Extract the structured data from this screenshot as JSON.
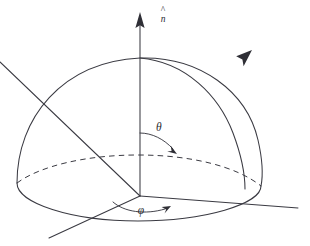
{
  "figure": {
    "kind": "spherical-coordinates-hemisphere",
    "background_color": "#ffffff",
    "line_color": "#3a3a42",
    "label_color": "#2b2b31",
    "labels": {
      "normal_vector": "n",
      "normal_vector_accent": "^",
      "normal_vector_full": "n̂",
      "polar_angle": "θ",
      "azimuthal_angle": "φ"
    },
    "elements": {
      "vertical_axis": "z-axis-with-arrow",
      "radial_vector": "radial-direction-arrow",
      "horizontal_axis_right": "x-axis-line",
      "horizontal_axis_left": "y-axis-line",
      "dome_outline": "hemisphere-silhouette",
      "meridian": "meridian-arc",
      "equator_front": "solid-front-half-ellipse",
      "equator_back": "dashed-back-half-ellipse",
      "theta_arc": "polar-angle-arc-with-arrowhead",
      "phi_arc": "azimuthal-angle-arc-with-arrowhead"
    }
  }
}
